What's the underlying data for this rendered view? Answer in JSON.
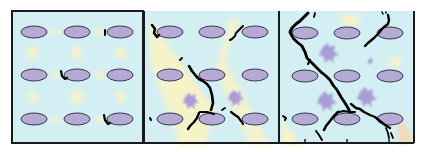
{
  "diagram": {
    "title": "",
    "colors": {
      "background": "#d3eff3",
      "particle_fill": "#b4aad3",
      "particle_stroke": "#3a3550",
      "crack": "#000000",
      "damage_zone": "#a99bd6",
      "stress_band": "#fbf3c4",
      "frame": "#1a1a1a"
    },
    "panels": [
      {
        "id": "panel-1",
        "stage": "initial",
        "crack_severity": "minor nucleation at particle edges"
      },
      {
        "id": "panel-2",
        "stage": "intermediate",
        "crack_severity": "diagonal crack linking particles"
      },
      {
        "id": "panel-3",
        "stage": "advanced",
        "crack_severity": "extensive branching crack network"
      }
    ],
    "grid": {
      "rows": 3,
      "cols": 3
    }
  }
}
